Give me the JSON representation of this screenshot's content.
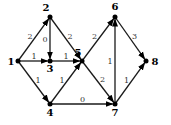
{
  "diagram": {
    "type": "directed-weighted-graph",
    "nodes": [
      {
        "id": "1",
        "label": "1",
        "x": 18,
        "y": 61
      },
      {
        "id": "2",
        "label": "2",
        "x": 50,
        "y": 17
      },
      {
        "id": "3",
        "label": "3",
        "x": 50,
        "y": 61
      },
      {
        "id": "4",
        "label": "4",
        "x": 50,
        "y": 104
      },
      {
        "id": "5",
        "label": "5",
        "x": 82,
        "y": 61
      },
      {
        "id": "6",
        "label": "6",
        "x": 115,
        "y": 17
      },
      {
        "id": "7",
        "label": "7",
        "x": 115,
        "y": 104
      },
      {
        "id": "8",
        "label": "8",
        "x": 146,
        "y": 61
      }
    ],
    "edges": [
      {
        "from": "1",
        "to": "2",
        "weight": "2"
      },
      {
        "from": "1",
        "to": "3",
        "weight": "1"
      },
      {
        "from": "1",
        "to": "4",
        "weight": "1"
      },
      {
        "from": "2",
        "to": "3",
        "weight": "0"
      },
      {
        "from": "2",
        "to": "5",
        "weight": "2"
      },
      {
        "from": "3",
        "to": "5",
        "weight": "1"
      },
      {
        "from": "4",
        "to": "5",
        "weight": "1"
      },
      {
        "from": "4",
        "to": "7",
        "weight": "0"
      },
      {
        "from": "5",
        "to": "6",
        "weight": "2"
      },
      {
        "from": "5",
        "to": "7",
        "weight": "2"
      },
      {
        "from": "7",
        "to": "6",
        "weight": "1"
      },
      {
        "from": "6",
        "to": "8",
        "weight": "3"
      },
      {
        "from": "7",
        "to": "8",
        "weight": "1"
      }
    ]
  }
}
